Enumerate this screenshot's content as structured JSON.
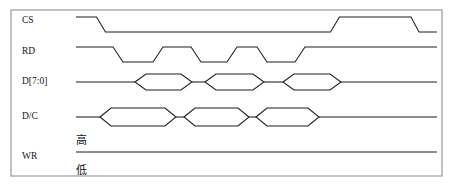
{
  "figure": {
    "kind": "timing-diagram",
    "background_color": "#ffffff",
    "frame": {
      "x": 11,
      "y": 10,
      "width": 431,
      "height": 166,
      "stroke": "#8d9095"
    },
    "wave_stroke": "#1b1d20",
    "label_color": "#15171a"
  },
  "labels": {
    "cs": "CS",
    "rd": "RD",
    "data": "D[7:0]",
    "dc": "D/C",
    "wr": "WR",
    "level_high": "高",
    "level_low": "低"
  },
  "label_positions": {
    "cs_x": 22,
    "cs_y": 21,
    "rd_x": 22,
    "rd_y": 52,
    "data_x": 22,
    "data_y": 82,
    "dc_x": 22,
    "dc_y": 117,
    "wr_x": 22,
    "wr_y": 157,
    "high_x": 76,
    "high_y": 141,
    "low_x": 76,
    "low_y": 171
  },
  "chart_data": {
    "type": "line",
    "title": "",
    "xlabel": "",
    "ylabel": "",
    "signals": [
      {
        "name": "CS",
        "row_label": "CS",
        "high_y": 17,
        "low_y": 32,
        "start_x": 76,
        "end_x": 437,
        "style": "digital",
        "transitions": [
          {
            "x": 101,
            "to": "low",
            "edge_width": 9
          },
          {
            "x": 335,
            "to": "high",
            "edge_width": 9
          },
          {
            "x": 415,
            "to": "low",
            "edge_width": 8
          }
        ],
        "initial": "high",
        "final": "low"
      },
      {
        "name": "RD",
        "row_label": "RD",
        "high_y": 47,
        "low_y": 62,
        "start_x": 76,
        "end_x": 437,
        "style": "digital",
        "initial": "high",
        "final": "high",
        "transitions": [
          {
            "x": 118,
            "to": "low",
            "edge_width": 10
          },
          {
            "x": 158,
            "to": "high",
            "edge_width": 10
          },
          {
            "x": 196,
            "to": "low",
            "edge_width": 10
          },
          {
            "x": 232,
            "to": "high",
            "edge_width": 10
          },
          {
            "x": 262,
            "to": "low",
            "edge_width": 10
          },
          {
            "x": 300,
            "to": "high",
            "edge_width": 10
          }
        ]
      },
      {
        "name": "D[7:0]",
        "row_label": "D[7:0]",
        "mid_y": 82,
        "top_y": 74,
        "bottom_y": 90,
        "start_x": 76,
        "end_x": 437,
        "style": "bus",
        "packets": [
          {
            "start": 135,
            "end": 192,
            "slew": 11
          },
          {
            "start": 205,
            "end": 264,
            "slew": 11
          },
          {
            "start": 283,
            "end": 341,
            "slew": 11
          }
        ]
      },
      {
        "name": "D/C",
        "row_label": "D/C",
        "mid_y": 117,
        "top_y": 108,
        "bottom_y": 126,
        "start_x": 76,
        "end_x": 437,
        "style": "bus",
        "packets": [
          {
            "start": 100,
            "end": 176,
            "slew": 11
          },
          {
            "start": 184,
            "end": 249,
            "slew": 11
          },
          {
            "start": 256,
            "end": 319,
            "slew": 11
          }
        ]
      },
      {
        "name": "WR",
        "row_label": "WR",
        "level_y": 152,
        "start_x": 76,
        "end_x": 437,
        "style": "static-high",
        "annotation_high": "高",
        "annotation_low": "低"
      }
    ],
    "notes": [
      "CS is active-low chip select: high, drops low for the transfer burst, returns high, drops low again at the end.",
      "RD produces three low-going read strobes.",
      "D[7:0] shows three valid data packets aligned with the read strobes.",
      "D/C shows three command/data state hexagons butted together.",
      "WR stays at the high level for the whole window; 高 marks the high rail and 低 the low rail."
    ]
  }
}
